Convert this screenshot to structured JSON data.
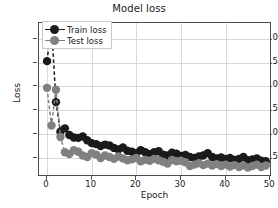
{
  "chart_data": {
    "type": "line",
    "title": "Model loss",
    "xlabel": "Epoch",
    "ylabel": "Loss",
    "grid": true,
    "legend_position": "upper left",
    "xlim": [
      -1.8,
      50.4
    ],
    "ylim": [
      0.1,
      3.33
    ],
    "xticks": [
      0,
      10,
      20,
      30,
      40,
      50
    ],
    "yticks": [
      0.5,
      1.0,
      1.5,
      2.0,
      2.5,
      3.0
    ],
    "xtick_labels": [
      "0",
      "10",
      "20",
      "30",
      "40",
      "50"
    ],
    "ytick_labels": [
      "0.5",
      "1.0",
      "1.5",
      "2.0",
      "2.5",
      "3.0"
    ],
    "marker": "circle",
    "linestyle": "dashed",
    "x": [
      0,
      1,
      2,
      3,
      4,
      5,
      6,
      7,
      8,
      9,
      10,
      11,
      12,
      13,
      14,
      15,
      16,
      17,
      18,
      19,
      20,
      21,
      22,
      23,
      24,
      25,
      26,
      27,
      28,
      29,
      30,
      31,
      32,
      33,
      34,
      35,
      36,
      37,
      38,
      39,
      40,
      41,
      42,
      43,
      44,
      45,
      46,
      47,
      48,
      49
    ],
    "series": [
      {
        "name": "Train loss",
        "color": "#1a1a1a",
        "values": [
          2.53,
          3.3,
          1.67,
          1.05,
          1.12,
          0.98,
          0.93,
          0.92,
          0.95,
          0.87,
          0.81,
          0.79,
          0.75,
          0.78,
          0.76,
          0.71,
          0.68,
          0.72,
          0.65,
          0.63,
          0.6,
          0.66,
          0.62,
          0.58,
          0.62,
          0.64,
          0.57,
          0.55,
          0.61,
          0.59,
          0.54,
          0.56,
          0.52,
          0.5,
          0.53,
          0.55,
          0.6,
          0.52,
          0.49,
          0.51,
          0.48,
          0.5,
          0.46,
          0.48,
          0.52,
          0.45,
          0.47,
          0.49,
          0.44,
          0.43
        ]
      },
      {
        "name": "Test loss",
        "color": "#808080",
        "values": [
          1.97,
          1.18,
          1.93,
          0.94,
          0.62,
          0.58,
          0.66,
          0.63,
          0.55,
          0.52,
          0.6,
          0.57,
          0.5,
          0.55,
          0.52,
          0.48,
          0.53,
          0.49,
          0.45,
          0.47,
          0.5,
          0.43,
          0.46,
          0.44,
          0.48,
          0.45,
          0.42,
          0.38,
          0.46,
          0.43,
          0.44,
          0.41,
          0.33,
          0.36,
          0.39,
          0.35,
          0.38,
          0.34,
          0.37,
          0.33,
          0.36,
          0.32,
          0.35,
          0.31,
          0.34,
          0.3,
          0.33,
          0.36,
          0.31,
          0.34
        ]
      }
    ]
  },
  "legend": {
    "entries": [
      {
        "label": "Train loss"
      },
      {
        "label": "Test loss"
      }
    ]
  }
}
